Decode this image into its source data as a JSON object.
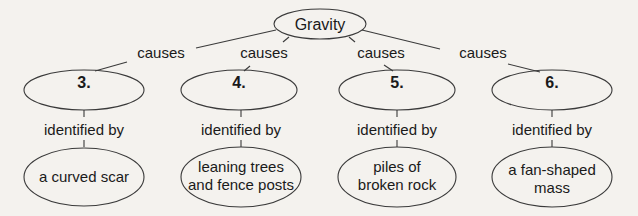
{
  "root": {
    "label": "Gravity"
  },
  "branches": [
    {
      "link": "causes",
      "number": "3.",
      "link2": "identified by",
      "evidence": [
        "a curved scar"
      ]
    },
    {
      "link": "causes",
      "number": "4.",
      "link2": "identified by",
      "evidence": [
        "leaning trees",
        "and fence posts"
      ]
    },
    {
      "link": "causes",
      "number": "5.",
      "link2": "identified by",
      "evidence": [
        "piles of",
        "broken rock"
      ]
    },
    {
      "link": "causes",
      "number": "6.",
      "link2": "identified by",
      "evidence": [
        "a fan-shaped",
        "mass"
      ]
    }
  ],
  "colors": {
    "stroke": "#3a3a3a",
    "background": "#f4f2ee",
    "text": "#1a1a1a"
  }
}
